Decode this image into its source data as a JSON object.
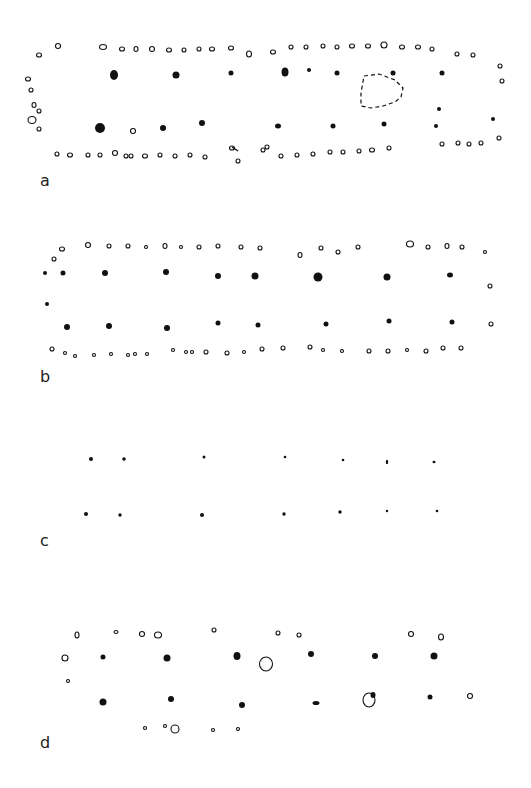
{
  "figure": {
    "type": "post-hole building plans",
    "colors": {
      "ink": "#111111",
      "background": "#ffffff"
    },
    "panels": [
      {
        "label": "a",
        "label_pos": [
          40,
          186
        ],
        "filled": [
          [
            114,
            75,
            4,
            5
          ],
          [
            176,
            75,
            3.5,
            3.5
          ],
          [
            231,
            73,
            2.5,
            2.5
          ],
          [
            285,
            72,
            3.5,
            4.5
          ],
          [
            309,
            70,
            2
          ],
          [
            337,
            73,
            2.5
          ],
          [
            393,
            73,
            2.5
          ],
          [
            442,
            73,
            2.5
          ],
          [
            100,
            128,
            5,
            5
          ],
          [
            163,
            128,
            3,
            3
          ],
          [
            202,
            123,
            3,
            3
          ],
          [
            278,
            126,
            3,
            2.5
          ],
          [
            333,
            126,
            2.5,
            2.5
          ],
          [
            384,
            124,
            2.5,
            2.5
          ],
          [
            436,
            126,
            2
          ],
          [
            439,
            109,
            2
          ],
          [
            493,
            119,
            2
          ]
        ],
        "open": [
          [
            39,
            55,
            2.5,
            2
          ],
          [
            58,
            46,
            2.5,
            2.5
          ],
          [
            103,
            47,
            3.5,
            2.5
          ],
          [
            122,
            49,
            2.5,
            2
          ],
          [
            136,
            49,
            2,
            2.5
          ],
          [
            152,
            49,
            2.5,
            2.5
          ],
          [
            169,
            50,
            2.5,
            2
          ],
          [
            184,
            50,
            2,
            2
          ],
          [
            199,
            49,
            2,
            2
          ],
          [
            212,
            49,
            2.5,
            2
          ],
          [
            231,
            48,
            2.5,
            2
          ],
          [
            249,
            54,
            2.5,
            3
          ],
          [
            273,
            52,
            2.5,
            2
          ],
          [
            291,
            47,
            2,
            2
          ],
          [
            306,
            47,
            2,
            2
          ],
          [
            323,
            46,
            2,
            2
          ],
          [
            337,
            47,
            2,
            2
          ],
          [
            352,
            46,
            2.5,
            2
          ],
          [
            368,
            46,
            2.5,
            2
          ],
          [
            384,
            45,
            3,
            3
          ],
          [
            402,
            47,
            2.5,
            2
          ],
          [
            418,
            47,
            2.5,
            2
          ],
          [
            432,
            49,
            2,
            2
          ],
          [
            457,
            54,
            2,
            2
          ],
          [
            473,
            55,
            2,
            2
          ],
          [
            500,
            66,
            2,
            2
          ],
          [
            502,
            81,
            2,
            2
          ],
          [
            28,
            79,
            2.5,
            2
          ],
          [
            31,
            90,
            2,
            2
          ],
          [
            34,
            105,
            2,
            2.5
          ],
          [
            39,
            111,
            2,
            2
          ],
          [
            32,
            120,
            4,
            3.5
          ],
          [
            39,
            129,
            2,
            2
          ],
          [
            133,
            131,
            2.5,
            2.5
          ],
          [
            57,
            154,
            2,
            2
          ],
          [
            70,
            155,
            2.5,
            2
          ],
          [
            88,
            155,
            2,
            2
          ],
          [
            100,
            155,
            2,
            2
          ],
          [
            115,
            153,
            2.5,
            2.5
          ],
          [
            126,
            156,
            2,
            2
          ],
          [
            131,
            156,
            2,
            2
          ],
          [
            145,
            156,
            2.5,
            2
          ],
          [
            160,
            155,
            2,
            2
          ],
          [
            175,
            156,
            2,
            2
          ],
          [
            190,
            155,
            2,
            2
          ],
          [
            205,
            157,
            2,
            2
          ],
          [
            232,
            148,
            2.5,
            2
          ],
          [
            238,
            161,
            2,
            2
          ],
          [
            263,
            150,
            2,
            2
          ],
          [
            267,
            147,
            2,
            2
          ],
          [
            281,
            156,
            2,
            2
          ],
          [
            297,
            155,
            2,
            2
          ],
          [
            313,
            154,
            2,
            2
          ],
          [
            330,
            152,
            2,
            2
          ],
          [
            343,
            152,
            2,
            2
          ],
          [
            359,
            151,
            2,
            2
          ],
          [
            372,
            150,
            2.5,
            2
          ],
          [
            389,
            148,
            2,
            2
          ],
          [
            442,
            144,
            2,
            2
          ],
          [
            458,
            143,
            2,
            2
          ],
          [
            469,
            144,
            2,
            2
          ],
          [
            481,
            143,
            2,
            2
          ],
          [
            499,
            138,
            2,
            2
          ]
        ],
        "dashed_ring": {
          "points": "364,76 379,74 395,80 403,88 401,97 395,102 383,106 371,108 361,106 361,93",
          "description": "dashed outline of feature"
        },
        "linked_pairs": [
          [
            232,
            147,
            238,
            151
          ]
        ]
      },
      {
        "label": "b",
        "label_pos": [
          40,
          382
        ],
        "filled": [
          [
            63,
            273,
            2.5,
            2.5
          ],
          [
            45,
            273,
            2
          ],
          [
            105,
            273,
            3,
            3
          ],
          [
            166,
            272,
            3,
            3
          ],
          [
            218,
            276,
            3,
            3
          ],
          [
            255,
            276,
            3.5,
            3.5
          ],
          [
            318,
            277,
            4.5,
            4.5
          ],
          [
            387,
            277,
            3.5,
            3.5
          ],
          [
            450,
            275,
            3,
            2.5
          ],
          [
            67,
            327,
            3,
            3
          ],
          [
            109,
            326,
            3,
            3
          ],
          [
            167,
            328,
            3,
            3
          ],
          [
            218,
            323,
            2.5,
            2.5
          ],
          [
            258,
            325,
            2.5,
            2.5
          ],
          [
            326,
            324,
            2.5,
            2.5
          ],
          [
            389,
            321,
            2.5,
            2.5
          ],
          [
            452,
            322,
            2.5,
            2.5
          ],
          [
            47,
            304,
            2
          ]
        ],
        "open": [
          [
            62,
            249,
            2.5,
            2
          ],
          [
            88,
            245,
            2.5,
            2.5
          ],
          [
            109,
            246,
            2,
            2
          ],
          [
            128,
            246,
            2,
            2
          ],
          [
            146,
            247,
            1.5,
            1.5
          ],
          [
            165,
            246,
            2,
            2.5
          ],
          [
            181,
            247,
            1.5,
            1.5
          ],
          [
            199,
            247,
            2,
            2
          ],
          [
            218,
            246,
            2,
            2
          ],
          [
            241,
            247,
            2,
            2
          ],
          [
            260,
            248,
            2,
            2
          ],
          [
            300,
            255,
            2,
            2.5
          ],
          [
            321,
            248,
            2,
            2
          ],
          [
            338,
            252,
            2,
            2
          ],
          [
            358,
            247,
            2,
            2
          ],
          [
            410,
            244,
            3.5,
            3
          ],
          [
            428,
            247,
            2,
            2
          ],
          [
            447,
            246,
            2,
            2.5
          ],
          [
            462,
            247,
            2,
            2
          ],
          [
            485,
            252,
            1.5,
            1.5
          ],
          [
            490,
            286,
            2,
            2
          ],
          [
            491,
            324,
            2,
            2
          ],
          [
            54,
            259,
            2,
            2
          ],
          [
            52,
            349,
            2,
            2
          ],
          [
            65,
            353,
            1.5,
            1.5
          ],
          [
            75,
            356,
            1.5,
            1.5
          ],
          [
            94,
            355,
            1.5,
            1.5
          ],
          [
            111,
            354,
            1.5,
            1.5
          ],
          [
            128,
            355,
            1.5,
            1.5
          ],
          [
            135,
            354,
            1.5,
            1.5
          ],
          [
            147,
            354,
            1.5,
            1.5
          ],
          [
            173,
            350,
            1.5,
            1.5
          ],
          [
            186,
            352,
            1.5,
            1.5
          ],
          [
            192,
            352,
            1.5,
            1.5
          ],
          [
            206,
            352,
            2,
            2
          ],
          [
            227,
            353,
            2,
            2
          ],
          [
            244,
            352,
            1.5,
            1.5
          ],
          [
            262,
            349,
            2,
            2
          ],
          [
            283,
            348,
            2,
            2
          ],
          [
            310,
            347,
            2,
            2
          ],
          [
            323,
            350,
            1.5,
            1.5
          ],
          [
            342,
            351,
            1.5,
            1.5
          ],
          [
            369,
            351,
            2,
            2
          ],
          [
            388,
            351,
            2,
            2
          ],
          [
            407,
            350,
            1.5,
            1.5
          ],
          [
            426,
            351,
            2,
            2
          ],
          [
            443,
            348,
            2,
            2
          ],
          [
            461,
            348,
            2,
            2
          ]
        ]
      },
      {
        "label": "c",
        "label_pos": [
          40,
          546
        ],
        "filled": [
          [
            91,
            459,
            2
          ],
          [
            124,
            459,
            1.8
          ],
          [
            204,
            457,
            1.5
          ],
          [
            285,
            457,
            1.3
          ],
          [
            343,
            460,
            1.3
          ],
          [
            387,
            462,
            1.2,
            2.2
          ],
          [
            434,
            462,
            1.5,
            1.3
          ],
          [
            86,
            514,
            2
          ],
          [
            120,
            515,
            1.7
          ],
          [
            202,
            515,
            2
          ],
          [
            284,
            514,
            1.7
          ],
          [
            340,
            512,
            1.7
          ],
          [
            387,
            511,
            1.2
          ],
          [
            437,
            511,
            1.3
          ]
        ],
        "open": []
      },
      {
        "label": "d",
        "label_pos": [
          40,
          748
        ],
        "filled": [
          [
            103,
            657,
            2.5,
            2.5
          ],
          [
            167,
            658,
            3.5,
            3.5
          ],
          [
            237,
            656,
            3.5,
            4
          ],
          [
            311,
            654,
            3,
            3
          ],
          [
            375,
            656,
            3,
            3
          ],
          [
            434,
            656,
            3.5,
            3.5
          ],
          [
            103,
            702,
            3.5,
            3.5
          ],
          [
            171,
            699,
            3,
            3
          ],
          [
            242,
            705,
            3,
            3
          ],
          [
            316,
            703,
            3.5,
            2
          ],
          [
            373,
            695,
            2.5,
            3
          ],
          [
            430,
            697,
            2.5,
            2.5
          ]
        ],
        "open": [
          [
            77,
            635,
            2,
            3
          ],
          [
            116,
            632,
            2,
            1.5
          ],
          [
            142,
            634,
            2.5,
            2.5
          ],
          [
            158,
            635,
            3.5,
            3
          ],
          [
            214,
            630,
            2,
            2
          ],
          [
            278,
            633,
            2,
            2
          ],
          [
            299,
            635,
            2,
            2
          ],
          [
            411,
            634,
            2.5,
            2.5
          ],
          [
            441,
            637,
            2.5,
            3
          ],
          [
            65,
            658,
            3,
            3
          ],
          [
            68,
            681,
            1.5,
            1.5
          ],
          [
            145,
            728,
            1.5,
            1.5
          ],
          [
            165,
            726,
            1.5,
            1.5
          ],
          [
            175,
            729,
            4,
            4
          ],
          [
            213,
            730,
            1.5,
            1.5
          ],
          [
            238,
            729,
            1.5,
            1.5
          ],
          [
            266,
            664,
            6.5,
            7
          ],
          [
            470,
            696,
            2.5,
            2.5
          ],
          [
            369,
            700,
            6,
            7
          ]
        ]
      }
    ]
  }
}
